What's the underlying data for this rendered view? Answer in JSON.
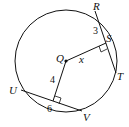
{
  "diagram": {
    "type": "circle-geometry",
    "points": {
      "R": "R",
      "S": "S",
      "T": "T",
      "Q": "Q",
      "U": "U",
      "V": "V"
    },
    "labels": {
      "RS": "3",
      "QS": "x",
      "Q_to_UV": "4",
      "UV_half": "6"
    },
    "colors": {
      "stroke": "#111111",
      "background": "#ffffff"
    }
  }
}
